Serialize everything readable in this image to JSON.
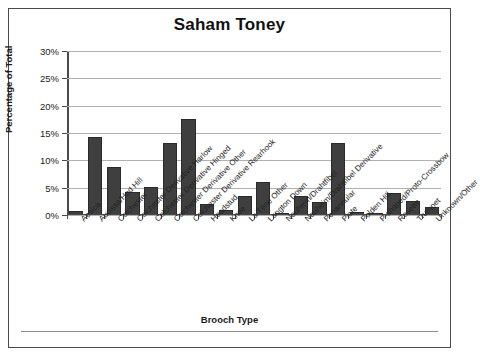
{
  "chart_data": {
    "type": "bar",
    "title": "Saham Toney",
    "xlabel": "Brooch Type",
    "ylabel": "Percentage of Total",
    "ylim": [
      0,
      30
    ],
    "ytick_labels": [
      "0%",
      "5%",
      "10%",
      "15%",
      "20%",
      "25%",
      "30%"
    ],
    "ytick_values": [
      0,
      5,
      10,
      15,
      20,
      25,
      30
    ],
    "grid": true,
    "legend": "none",
    "bar_color": "#3f3f3f",
    "categories": [
      "Aesica",
      "Aucissa/Hod Hill",
      "Colchester",
      "Colchester Derivative Harlow",
      "Colchester Derivative Hinged",
      "Colchester Derivative Other",
      "Colchester Derivative Rearhook",
      "Headstud",
      "Knee",
      "La Tène Other",
      "Langton Down",
      "Nauheim/Drahtfibel",
      "Nauheim/Drahtfibel Derivative",
      "Penannular",
      "Plate",
      "Polden Hill",
      "P-shaped/Proto-Crossbow",
      "Rosette",
      "Trumpet",
      "Unknown/Other"
    ],
    "values": [
      0.7,
      14.2,
      8.8,
      4.2,
      5.2,
      13.1,
      17.5,
      2.0,
      1.0,
      3.5,
      6.0,
      0.2,
      3.5,
      2.3,
      13.1,
      0.6,
      0.1,
      4.0,
      2.6,
      1.4
    ]
  },
  "axis": {
    "y_title": "Percentage of Total",
    "x_title": "Brooch Type"
  }
}
